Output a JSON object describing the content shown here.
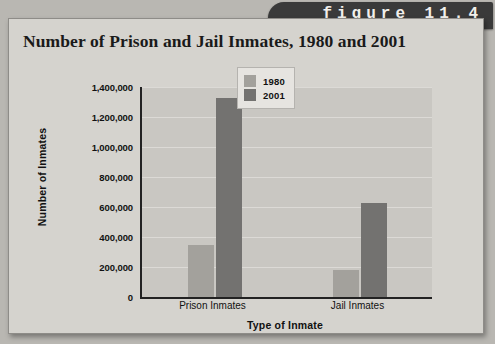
{
  "figure": {
    "tab_label": "figure 11.4"
  },
  "chart_data": {
    "type": "bar",
    "title": "Number of Prison and Jail Inmates, 1980 and 2001",
    "xlabel": "Type of Inmate",
    "ylabel": "Number of Inmates",
    "categories": [
      "Prison Inmates",
      "Jail Inmates"
    ],
    "series": [
      {
        "name": "1980",
        "color": "#a3a19c",
        "values": [
          347000,
          180000
        ]
      },
      {
        "name": "2001",
        "color": "#737270",
        "values": [
          1327000,
          625000
        ]
      }
    ],
    "ylim": [
      0,
      1400000
    ],
    "ytick_step": 200000,
    "ytick_labels": [
      "1,400,000",
      "1,200,000",
      "1,000,000",
      "800,000",
      "600,000",
      "400,000",
      "200,000",
      "0"
    ],
    "ytick_values": [
      1400000,
      1200000,
      1000000,
      800000,
      600000,
      400000,
      200000,
      0
    ],
    "grid": true,
    "legend_position": "top-right",
    "plot_background": "#c9c7c2"
  }
}
